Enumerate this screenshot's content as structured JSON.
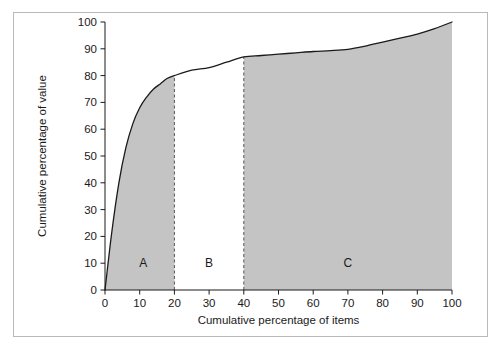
{
  "figure": {
    "border_color": "#b9b9b9",
    "background": "#ffffff"
  },
  "axes": {
    "x_title": "Cumulative percentage of items",
    "y_title": "Cumulative percentage of value",
    "x_ticks": [
      0,
      10,
      20,
      30,
      40,
      50,
      60,
      70,
      80,
      90,
      100
    ],
    "y_ticks": [
      0,
      10,
      20,
      30,
      40,
      50,
      60,
      70,
      80,
      90,
      100
    ]
  },
  "regions": [
    {
      "label": "A",
      "x_start": 0,
      "x_end": 20,
      "shaded": true,
      "center": 11
    },
    {
      "label": "B",
      "x_start": 20,
      "x_end": 40,
      "shaded": false,
      "center": 30
    },
    {
      "label": "C",
      "x_start": 40,
      "x_end": 100,
      "shaded": true,
      "center": 70
    }
  ],
  "dividers": [
    {
      "x": 20,
      "y_top": 80
    },
    {
      "x": 40,
      "y_top": 87
    }
  ],
  "colors": {
    "shade": "#c4c4c4",
    "curve": "#1a1a1a",
    "divider": "#555555",
    "axis": "#1a1a1a"
  },
  "caption": "",
  "chart_data": {
    "type": "line",
    "title": "",
    "xlabel": "Cumulative percentage of items",
    "ylabel": "Cumulative percentage of value",
    "xlim": [
      0,
      100
    ],
    "ylim": [
      0,
      100
    ],
    "grid": false,
    "legend": "none",
    "series": [
      {
        "name": "Cumulative value curve",
        "x": [
          0,
          2,
          4,
          6,
          8,
          10,
          12,
          14,
          16,
          18,
          20,
          25,
          30,
          35,
          40,
          45,
          50,
          55,
          60,
          65,
          70,
          75,
          80,
          85,
          90,
          95,
          100
        ],
        "y": [
          0,
          22,
          40,
          53,
          62,
          68,
          72,
          75,
          77,
          79,
          80,
          82,
          83,
          85,
          87,
          87.5,
          88,
          88.5,
          89,
          89.3,
          89.8,
          91,
          92.5,
          94,
          95.5,
          97.5,
          100
        ]
      }
    ],
    "annotations": [
      {
        "text": "A",
        "x": 11,
        "y": 10
      },
      {
        "text": "B",
        "x": 30,
        "y": 10
      },
      {
        "text": "C",
        "x": 70,
        "y": 10
      }
    ],
    "vertical_lines": [
      {
        "x": 20,
        "style": "dashed",
        "to_y": 80
      },
      {
        "x": 40,
        "style": "dashed",
        "to_y": 87
      }
    ],
    "shaded_x_bands": [
      [
        0,
        20
      ],
      [
        40,
        100
      ]
    ]
  }
}
